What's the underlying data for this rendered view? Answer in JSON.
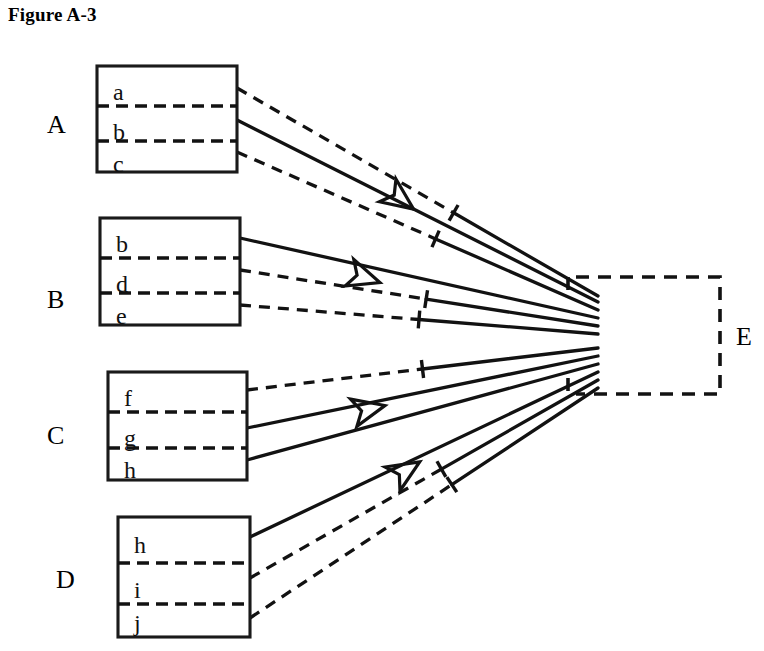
{
  "figure": {
    "title": "Figure A-3"
  },
  "groups": [
    {
      "label": "A",
      "label_x": 47,
      "label_y": 133,
      "box": {
        "x": 97,
        "y": 66,
        "w": 140,
        "h": 106
      },
      "items": [
        {
          "text": "a",
          "x": 113,
          "y": 100
        },
        {
          "text": "b",
          "x": 113,
          "y": 140
        },
        {
          "text": "c",
          "x": 113,
          "y": 172
        }
      ],
      "dividers_y": [
        106,
        141
      ],
      "exits": [
        {
          "y": 88,
          "style": "dashed"
        },
        {
          "y": 120,
          "style": "solid"
        },
        {
          "y": 152,
          "style": "dashed"
        }
      ]
    },
    {
      "label": "B",
      "label_x": 47,
      "label_y": 308,
      "box": {
        "x": 100,
        "y": 218,
        "w": 140,
        "h": 107
      },
      "items": [
        {
          "text": "b",
          "x": 116,
          "y": 252
        },
        {
          "text": "d",
          "x": 116,
          "y": 292
        },
        {
          "text": "e",
          "x": 116,
          "y": 324
        }
      ],
      "dividers_y": [
        258,
        293
      ],
      "exits": [
        {
          "y": 238,
          "style": "solid"
        },
        {
          "y": 270,
          "style": "dashed"
        },
        {
          "y": 305,
          "style": "dashed"
        }
      ]
    },
    {
      "label": "C",
      "label_x": 47,
      "label_y": 444,
      "box": {
        "x": 108,
        "y": 372,
        "w": 139,
        "h": 108
      },
      "items": [
        {
          "text": "f",
          "x": 124,
          "y": 406
        },
        {
          "text": "g",
          "x": 124,
          "y": 446
        },
        {
          "text": "h",
          "x": 124,
          "y": 478
        }
      ],
      "dividers_y": [
        412,
        448
      ],
      "exits": [
        {
          "y": 390,
          "style": "dashed"
        },
        {
          "y": 428,
          "style": "dashed"
        },
        {
          "y": 460,
          "style": "solid"
        }
      ]
    },
    {
      "label": "D",
      "label_x": 56,
      "label_y": 588,
      "box": {
        "x": 118,
        "y": 517,
        "w": 132,
        "h": 120
      },
      "items": [
        {
          "text": "h",
          "x": 134,
          "y": 553
        },
        {
          "text": "i",
          "x": 134,
          "y": 598
        },
        {
          "text": "j",
          "x": 134,
          "y": 631
        },
        {
          "text": "",
          "x": 0,
          "y": 0
        }
      ],
      "dividers_y": [
        563,
        604
      ],
      "exits": [
        {
          "y": 537,
          "style": "solid"
        },
        {
          "y": 578,
          "style": "dashed"
        },
        {
          "y": 618,
          "style": "dashed"
        }
      ]
    }
  ],
  "target": {
    "label": "E",
    "label_x": 736,
    "label_y": 345,
    "box": {
      "x": 568,
      "y": 277,
      "w": 152,
      "h": 117
    },
    "open_side": "left",
    "open_from_y": 296,
    "open_to_y": 376
  },
  "edges": [
    {
      "from_group": "A",
      "from_exit": 0,
      "to_y": 296,
      "style": "dashed",
      "tick_at": 0.6,
      "arrow": false
    },
    {
      "from_group": "A",
      "from_exit": 1,
      "to_y": 302,
      "style": "solid",
      "tick_at": 0.0,
      "arrow": true
    },
    {
      "from_group": "A",
      "from_exit": 2,
      "to_y": 310,
      "style": "dashed",
      "tick_at": 0.55,
      "arrow": false
    },
    {
      "from_group": "B",
      "from_exit": 0,
      "to_y": 318,
      "style": "solid",
      "tick_at": 0.0,
      "arrow": true
    },
    {
      "from_group": "B",
      "from_exit": 1,
      "to_y": 326,
      "style": "dashed",
      "tick_at": 0.52,
      "arrow": false
    },
    {
      "from_group": "B",
      "from_exit": 2,
      "to_y": 334,
      "style": "dashed",
      "tick_at": 0.5,
      "arrow": false
    },
    {
      "from_group": "C",
      "from_exit": 0,
      "to_y": 348,
      "style": "dashed",
      "tick_at": 0.5,
      "arrow": false
    },
    {
      "from_group": "C",
      "from_exit": 1,
      "to_y": 356,
      "style": "solid",
      "tick_at": 0.0,
      "arrow": true
    },
    {
      "from_group": "C",
      "from_exit": 2,
      "to_y": 364,
      "style": "solid",
      "tick_at": 0.0,
      "arrow": false
    },
    {
      "from_group": "D",
      "from_exit": 0,
      "to_y": 372,
      "style": "solid",
      "tick_at": 0.0,
      "arrow": true
    },
    {
      "from_group": "D",
      "from_exit": 1,
      "to_y": 380,
      "style": "dashed",
      "tick_at": 0.55,
      "arrow": false
    },
    {
      "from_group": "D",
      "from_exit": 2,
      "to_y": 388,
      "style": "dashed",
      "tick_at": 0.58,
      "arrow": false
    }
  ],
  "arrowheads": [
    {
      "x": 412,
      "y": 208,
      "angle": 36
    },
    {
      "x": 378,
      "y": 282,
      "angle": 18
    },
    {
      "x": 383,
      "y": 406,
      "angle": -13
    },
    {
      "x": 418,
      "y": 463,
      "angle": -32
    }
  ],
  "colors": {
    "ink": "#121212",
    "paper": "#ffffff"
  }
}
